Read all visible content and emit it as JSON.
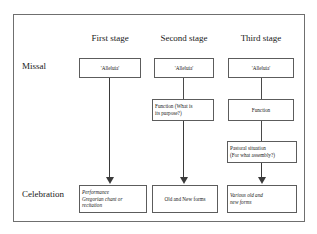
{
  "figure": {
    "title": "",
    "colors": {
      "frame_border": "#6f6f6f",
      "box_border": "#5c5c5c",
      "arrow": "#3a3a3a",
      "text": "#1a1a1a",
      "background": "#ffffff"
    }
  },
  "columns": [
    {
      "id": "first",
      "label": "First stage"
    },
    {
      "id": "second",
      "label": "Second stage"
    },
    {
      "id": "third",
      "label": "Third stage"
    }
  ],
  "rows": [
    {
      "id": "missal",
      "label": "Missal"
    },
    {
      "id": "celebration",
      "label": "Celebration"
    }
  ],
  "nodes": {
    "c1_missal": "'Alleluia'",
    "c1_celebration_line1": "Performance",
    "c1_celebration_line2": "Gregorian chant or",
    "c1_celebration_line3": "recitation",
    "c2_missal": "'Alleluia'",
    "c2_function_line1": "Function (What is",
    "c2_function_line2": "its purpose?)",
    "c2_celebration": "Old and New forms",
    "c3_missal": "'Alleluia'",
    "c3_function": "Function",
    "c3_pastoral_line1": "Pastoral situation",
    "c3_pastoral_line2": "(For what assembly?)",
    "c3_celebration_line1": "Various old and",
    "c3_celebration_line2": "new forms"
  }
}
